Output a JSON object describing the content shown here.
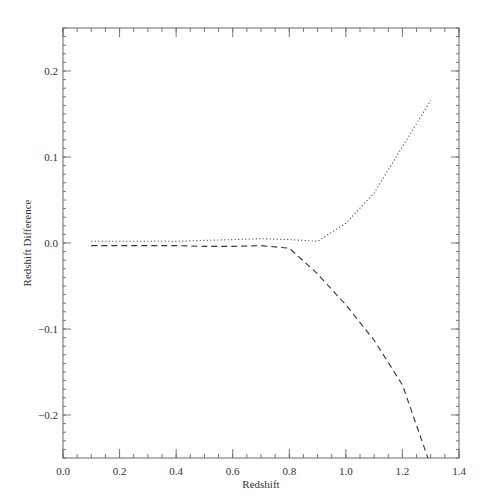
{
  "chart_data": {
    "type": "line",
    "title": "",
    "xlabel": "Redshift",
    "ylabel": "Redshift Difference",
    "xlim": [
      0.0,
      1.4
    ],
    "ylim": [
      -0.25,
      0.25
    ],
    "grid": false,
    "legend": "none",
    "x_ticks": [
      "0.0",
      "0.2",
      "0.4",
      "0.6",
      "0.8",
      "1.0",
      "1.2",
      "1.4"
    ],
    "y_ticks": [
      "0.2",
      "0.1",
      "0.0",
      "-0.1",
      "-0.2"
    ],
    "x_tick_values": [
      0.0,
      0.2,
      0.4,
      0.6,
      0.8,
      1.0,
      1.2,
      1.4
    ],
    "y_tick_values": [
      0.2,
      0.1,
      0.0,
      -0.1,
      -0.2
    ],
    "x_minor_step": 0.05,
    "y_minor_step": 0.01,
    "series": [
      {
        "name": "dotted",
        "style": "dotted",
        "x": [
          0.1,
          0.2,
          0.3,
          0.4,
          0.5,
          0.6,
          0.7,
          0.8,
          0.9,
          1.0,
          1.1,
          1.2,
          1.3
        ],
        "y": [
          0.002,
          0.002,
          0.002,
          0.002,
          0.003,
          0.004,
          0.005,
          0.004,
          0.002,
          0.023,
          0.058,
          0.112,
          0.166
        ]
      },
      {
        "name": "dashed",
        "style": "dashed",
        "x": [
          0.1,
          0.2,
          0.3,
          0.4,
          0.5,
          0.6,
          0.7,
          0.8,
          0.9,
          1.0,
          1.1,
          1.2,
          1.29
        ],
        "y": [
          -0.003,
          -0.003,
          -0.003,
          -0.003,
          -0.004,
          -0.004,
          -0.003,
          -0.006,
          -0.036,
          -0.072,
          -0.113,
          -0.165,
          -0.25
        ]
      }
    ]
  },
  "plot": {
    "left": 63,
    "right": 459,
    "top": 28,
    "bottom": 458,
    "line_color": "#333333",
    "axis_color": "#555555"
  }
}
